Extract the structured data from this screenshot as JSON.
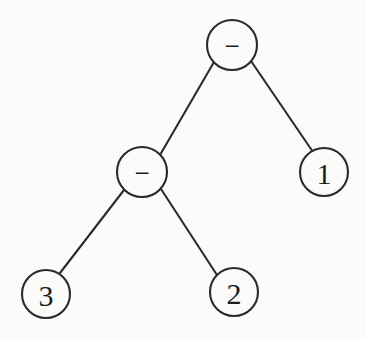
{
  "figure": {
    "kind": "binary-expression-tree",
    "background_color": "#fbfbfa",
    "stroke_color": "#2a2a2a",
    "label_color": "#1d1d1d",
    "node_radius": 25,
    "edge_width": 2.1
  },
  "nodes": {
    "root": {
      "id": "root",
      "label": "−",
      "kind": "operator",
      "icon_name": "minus-operator-glyph",
      "cx": 232,
      "cy": 45,
      "r": 25
    },
    "internal_left": {
      "id": "internal_left",
      "label": "−",
      "kind": "operator",
      "icon_name": "minus-operator-glyph",
      "cx": 142,
      "cy": 172,
      "r": 25
    },
    "leaf_right": {
      "id": "leaf_right",
      "label": "1",
      "kind": "operand",
      "icon_name": "digit-one-glyph",
      "cx": 324,
      "cy": 172,
      "r": 24
    },
    "leaf_left": {
      "id": "leaf_left",
      "label": "3",
      "kind": "operand",
      "icon_name": "digit-three-glyph",
      "cx": 46,
      "cy": 294,
      "r": 24
    },
    "leaf_middle": {
      "id": "leaf_middle",
      "label": "2",
      "kind": "operand",
      "icon_name": "digit-two-glyph",
      "cx": 234,
      "cy": 292,
      "r": 24
    }
  },
  "edges": [
    {
      "id": "root-to-internal-left",
      "from": "root",
      "to": "internal_left",
      "x1": 214,
      "y1": 62,
      "x2": 160,
      "y2": 155
    },
    {
      "id": "root-to-leaf-right",
      "from": "root",
      "to": "leaf_right",
      "x1": 251,
      "y1": 61,
      "x2": 313,
      "y2": 152
    },
    {
      "id": "internal-left-to-leaf-left",
      "from": "internal_left",
      "to": "leaf_left",
      "x1": 124,
      "y1": 190,
      "x2": 60,
      "y2": 273
    },
    {
      "id": "internal-left-to-leaf-middle",
      "from": "internal_left",
      "to": "leaf_middle",
      "x1": 161,
      "y1": 189,
      "x2": 217,
      "y2": 275
    }
  ]
}
